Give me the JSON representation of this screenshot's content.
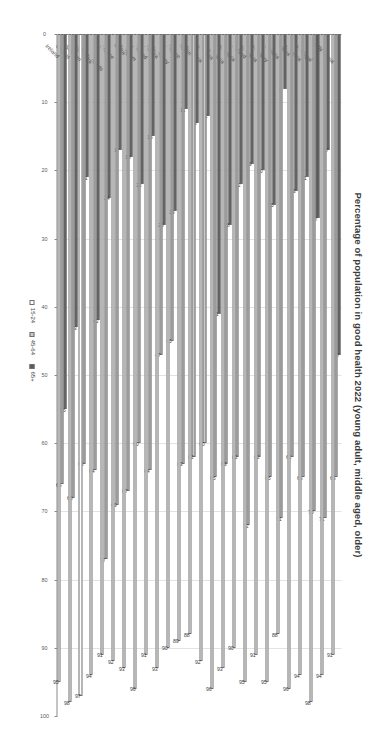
{
  "chart_data": {
    "type": "bar",
    "orientation": "horizontal",
    "title": "Percentage of population in good health 2022 (young adult, middle aged, older)",
    "xlabel": "",
    "ylabel": "",
    "xlim": [
      100,
      0
    ],
    "x_reversed": true,
    "xticks": [
      100,
      90,
      80,
      70,
      60,
      50,
      40,
      30,
      20,
      10,
      0
    ],
    "grid": true,
    "legend_position": "bottom",
    "legend": [
      "15-24",
      "45-64",
      "65+"
    ],
    "categories": [
      "Romania",
      "Italy",
      "Portugal",
      "Czechia",
      "Latvia",
      "Croatia",
      "Hungary",
      "Slovakia",
      "Poland",
      "Bulgaria",
      "Lithuania",
      "Estonia",
      "Slovenia",
      "Spain",
      "France",
      "Germany",
      "Austria",
      "Finland",
      "Belgium",
      "Malta",
      "Greece",
      "Netherlands",
      "Denmark",
      "Sweden",
      "Cyprus",
      "Ireland"
    ],
    "series": [
      {
        "name": "15-24",
        "color": "#ffffff",
        "values": [
          91,
          94,
          98,
          94,
          96,
          88,
          95,
          91,
          95,
          90,
          93,
          96,
          92,
          88,
          89,
          90,
          93,
          91,
          96,
          93,
          92,
          91,
          94,
          97,
          98,
          95
        ]
      },
      {
        "name": "45-64",
        "color": "#c9c9c9",
        "values": [
          65,
          71,
          70,
          65,
          62,
          71,
          65,
          62,
          72,
          62,
          63,
          65,
          60,
          62,
          63,
          45,
          47,
          64,
          60,
          67,
          69,
          77,
          64,
          63,
          68,
          66
        ]
      },
      {
        "name": "65+",
        "color": "#595959",
        "values": [
          47,
          17,
          27,
          21,
          23,
          8,
          25,
          20,
          19,
          22,
          28,
          41,
          12,
          13,
          11,
          26,
          28,
          15,
          22,
          18,
          17,
          24,
          42,
          21,
          43,
          55
        ]
      }
    ],
    "data_labels": {
      "a1524": [
        91,
        94,
        98,
        94,
        96,
        88,
        95,
        91,
        95,
        90,
        93,
        96,
        92,
        88,
        89,
        90,
        93,
        91,
        96,
        93,
        92,
        91,
        94,
        97,
        98,
        95
      ],
      "a4564": [
        65,
        71,
        70,
        65,
        62,
        71,
        65,
        62,
        72,
        62,
        63,
        65,
        60,
        62,
        63,
        45,
        47,
        64,
        60,
        67,
        69,
        77,
        64,
        63,
        68,
        66
      ],
      "a65": [
        47,
        17,
        27,
        21,
        23,
        8,
        25,
        20,
        19,
        22,
        28,
        41,
        12,
        13,
        11,
        26,
        28,
        15,
        22,
        18,
        17,
        24,
        42,
        21,
        43,
        55
      ]
    }
  },
  "colors": {
    "a1524": "#ffffff",
    "a4564": "#c9c9c9",
    "a65": "#595959",
    "axis": "#8a8a8a",
    "grid": "#e3e3e3",
    "text": "#3d3d3d"
  }
}
